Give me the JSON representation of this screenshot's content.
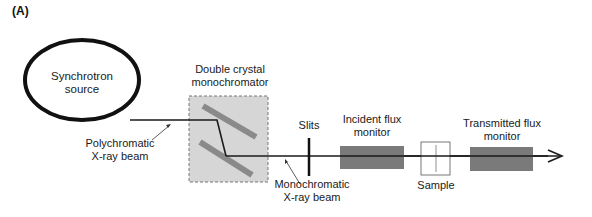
{
  "figure": {
    "panel_label": "(A)",
    "components": {
      "source": {
        "line1": "Synchrotron",
        "line2": "source"
      },
      "monochromator": {
        "line1": "Double crystal",
        "line2": "monochromator"
      },
      "slits": {
        "label": "Slits"
      },
      "incident_monitor": {
        "line1": "Incident flux",
        "line2": "monitor"
      },
      "sample": {
        "label": "Sample"
      },
      "transmitted_monitor": {
        "line1": "Transmitted flux",
        "line2": "monitor"
      }
    },
    "beams": {
      "polychromatic": {
        "line1": "Polychromatic",
        "line2": "X-ray beam"
      },
      "monochromatic": {
        "line1": "Monochromatic",
        "line2": "X-ray beam"
      }
    },
    "colors": {
      "line": "#1a1a1a",
      "crystal": "#8a8a8a",
      "mono_box_fill": "#d6d6d6",
      "monitor_fill": "#7a7a7a",
      "sample_line": "#c8c8c8"
    }
  }
}
